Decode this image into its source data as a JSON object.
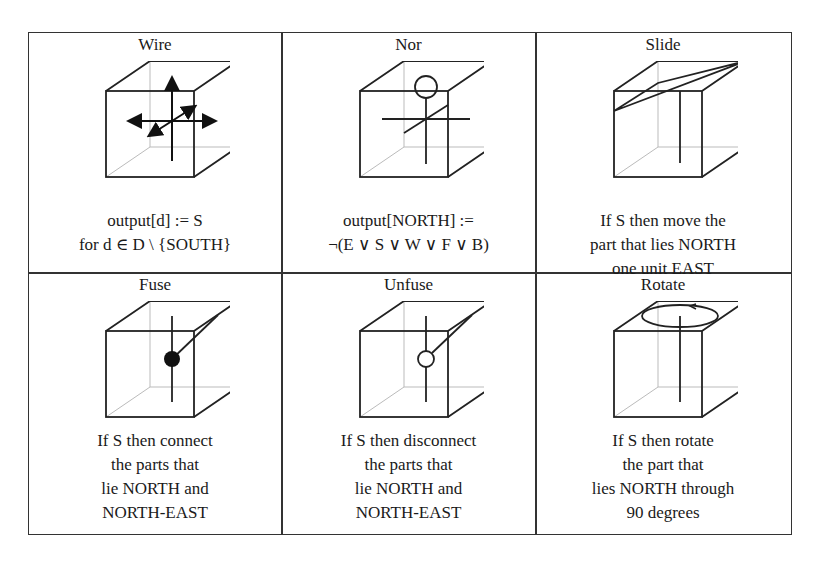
{
  "figure": {
    "cells": [
      {
        "title": "Wire",
        "icon": "cube-with-arrows",
        "lines": [
          "output[d] := S",
          "for d ∈ D \\ {SOUTH}"
        ]
      },
      {
        "title": "Nor",
        "icon": "cube-with-nor-cross",
        "lines": [
          "output[NORTH] :=",
          "¬(E ∨ S ∨ W ∨ F ∨ B)"
        ]
      },
      {
        "title": "Slide",
        "icon": "cube-with-slide-plane",
        "lines": [
          "If S then move the",
          "part that lies NORTH",
          "one unit EAST"
        ]
      },
      {
        "title": "Fuse",
        "icon": "cube-with-filled-node",
        "lines": [
          "If S then connect",
          "the parts that",
          "lie NORTH and",
          "NORTH-EAST"
        ]
      },
      {
        "title": "Unfuse",
        "icon": "cube-with-open-node",
        "lines": [
          "If S then disconnect",
          "the parts that",
          "lie NORTH and",
          "NORTH-EAST"
        ]
      },
      {
        "title": "Rotate",
        "icon": "cube-with-rotation-ellipse",
        "lines": [
          "If S then rotate",
          "the part that",
          "lies NORTH through",
          "90 degrees"
        ]
      }
    ]
  }
}
